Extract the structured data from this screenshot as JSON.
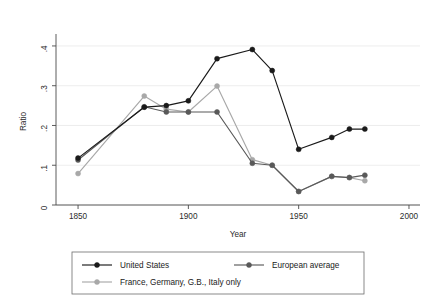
{
  "chart_data": {
    "type": "line",
    "title": "",
    "xlabel": "Year",
    "ylabel": "Ratio",
    "xlim": [
      1840,
      2005
    ],
    "ylim": [
      0,
      0.42
    ],
    "xticks": [
      1850,
      1900,
      1950,
      2000
    ],
    "xticklabels": [
      "1850",
      "1900",
      "1950",
      "2000"
    ],
    "yticks": [
      0,
      0.1,
      0.2,
      0.3,
      0.4
    ],
    "yticklabels": [
      "0",
      ".1",
      ".2",
      ".3",
      ".4"
    ],
    "grid": "horizontal",
    "legend_position": "below-axes",
    "series": [
      {
        "name": "United States",
        "color": "#1a1a1a",
        "marker": "circle",
        "x": [
          1850,
          1880,
          1890,
          1900,
          1913,
          1929,
          1938,
          1950,
          1965,
          1973,
          1980
        ],
        "y": [
          0.118,
          0.246,
          0.25,
          0.262,
          0.368,
          0.391,
          0.338,
          0.14,
          0.17,
          0.191,
          0.191
        ]
      },
      {
        "name": "European average",
        "color": "#595959",
        "marker": "circle",
        "x": [
          1850,
          1880,
          1890,
          1900,
          1913,
          1929,
          1938,
          1950,
          1965,
          1973,
          1980
        ],
        "y": [
          0.113,
          0.247,
          0.234,
          0.234,
          0.234,
          0.105,
          0.1,
          0.034,
          0.072,
          0.069,
          0.075
        ]
      },
      {
        "name": "France, Germany, G.B., Italy only",
        "color": "#a8a8a8",
        "marker": "circle",
        "x": [
          1850,
          1880,
          1890,
          1900,
          1913,
          1929,
          1938,
          1950,
          1965,
          1973,
          1980
        ],
        "y": [
          0.079,
          0.274,
          0.241,
          0.234,
          0.299,
          0.114,
          0.1,
          0.034,
          0.072,
          0.069,
          0.061
        ]
      }
    ]
  },
  "axes": {
    "ylabel": "Ratio",
    "xlabel": "Year"
  },
  "legend": {
    "entries": [
      {
        "label": "United States",
        "color": "#1a1a1a"
      },
      {
        "label": "European average",
        "color": "#595959"
      },
      {
        "label": "France, Germany, G.B., Italy only",
        "color": "#a8a8a8"
      }
    ]
  }
}
